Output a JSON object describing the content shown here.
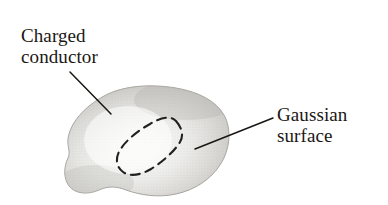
{
  "figure": {
    "background_color": "#ffffff",
    "width": 388,
    "height": 205
  },
  "labels": {
    "conductor": {
      "line1": "Charged",
      "line2": "conductor"
    },
    "gaussian": {
      "line1": "Gaussian",
      "line2": "surface"
    }
  },
  "colors": {
    "text": "#1a1713",
    "leader_line": "#1a1713",
    "blob_light": "#fbfbfa",
    "blob_mid": "#d3d2cf",
    "blob_dark": "#a9a8a4",
    "blob_edge": "#9b9a95",
    "dashed_curve": "#23211d"
  },
  "shapes": {
    "conductor_blob": {
      "name": "charged-conductor-blob",
      "description": "irregular shaded gray solid with pointed left vertex and lumpy bottom edge"
    },
    "gaussian_surface": {
      "name": "gaussian-surface-dashed-curve",
      "description": "tilted closed dashed loop inside the conductor"
    }
  },
  "leader_lines": {
    "conductor": {
      "from": [
        70,
        72
      ],
      "to": [
        110,
        113
      ]
    },
    "gaussian": {
      "from": [
        272,
        118
      ],
      "to": [
        196,
        148
      ]
    }
  }
}
